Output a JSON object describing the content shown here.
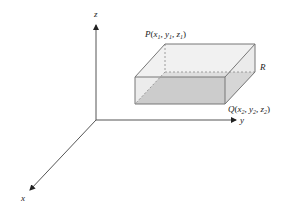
{
  "diagram": {
    "type": "3d-coordinate-box",
    "axes": {
      "x": {
        "label": "x"
      },
      "y": {
        "label": "y"
      },
      "z": {
        "label": "z"
      }
    },
    "points": {
      "P": {
        "name": "P",
        "coords": [
          "x",
          "1",
          "y",
          "1",
          "z",
          "1"
        ]
      },
      "Q": {
        "name": "Q",
        "coords": [
          "x",
          "2",
          "y",
          "2",
          "z",
          "2"
        ]
      },
      "R": {
        "name": "R"
      }
    },
    "colors": {
      "axis": "#555555",
      "box_edge": "#777777",
      "box_top": "#ececec",
      "box_front": "#dcdcdc",
      "box_side": "#e2e2e2",
      "box_bottom": "#b8b8b8"
    }
  }
}
